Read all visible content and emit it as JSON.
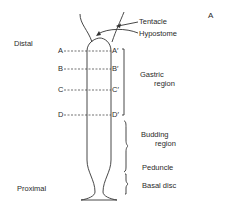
{
  "figure": {
    "panel_label": "A",
    "axis_labels": {
      "top": "Distal",
      "bottom": "Proximal"
    },
    "structures": {
      "tentacle": "Tentacle",
      "hypostome": "Hypostome"
    },
    "sections": [
      {
        "left": "A",
        "right": "A′"
      },
      {
        "left": "B",
        "right": "B′"
      },
      {
        "left": "C",
        "right": "C′"
      },
      {
        "left": "D",
        "right": "D′"
      }
    ],
    "regions": [
      {
        "line1": "Gastric",
        "line2": "region"
      },
      {
        "line1": "Budding",
        "line2": "region"
      },
      {
        "line1": "Peduncle"
      },
      {
        "line1": "Basal disc"
      }
    ]
  }
}
